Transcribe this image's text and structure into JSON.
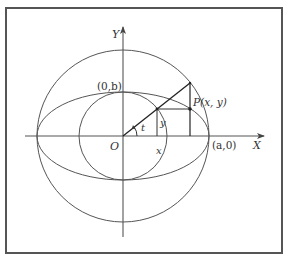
{
  "figure": {
    "top_caption_fragment": "",
    "axes": {
      "x_label": "X",
      "y_label": "Y",
      "origin_label": "O"
    },
    "labels": {
      "point_b": "(0,b)",
      "point_a": "(a,0)",
      "point_p": "P(x, y)",
      "angle": "t",
      "y_segment": "y",
      "x_segment": "x"
    },
    "colors": {
      "stroke": "#555555",
      "heavy_stroke": "#222222",
      "frame": "#555555",
      "background": "#ffffff"
    },
    "geometry": {
      "center": [
        123,
        136
      ],
      "outer_circle_radius": 86,
      "inner_circle_radius": 44,
      "ellipse_rx": 86,
      "ellipse_ry": 44,
      "angle_t_degrees": 38
    }
  }
}
